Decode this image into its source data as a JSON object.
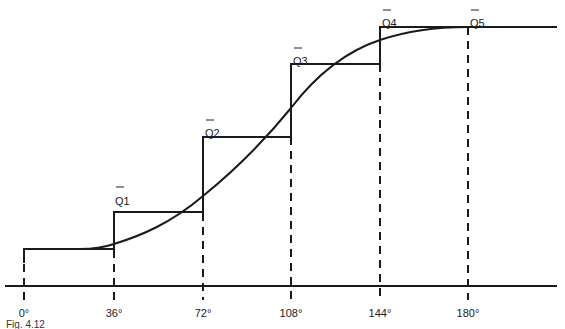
{
  "diagram": {
    "type": "staircase-approximation-of-sinusoid",
    "x_axis": {
      "ticks": [
        "0°",
        "36°",
        "72°",
        "108°",
        "144°",
        "180°"
      ],
      "tick_values": [
        0,
        36,
        72,
        108,
        144,
        180
      ]
    },
    "step_labels": [
      {
        "name": "Q1",
        "overbar": true,
        "x_range": [
          "36°",
          "72°"
        ]
      },
      {
        "name": "Q2",
        "overbar": true,
        "x_range": [
          "72°",
          "108°"
        ]
      },
      {
        "name": "Q3",
        "overbar": true,
        "x_range": [
          "108°",
          "144°"
        ]
      },
      {
        "name": "Q4",
        "overbar": true,
        "x_range": [
          "144°",
          "180°"
        ]
      },
      {
        "name": "Q5",
        "overbar": true,
        "x_range": [
          "180°",
          "end"
        ]
      }
    ],
    "curve": "smooth S-shaped curve rising from the 0° level to the Q5 level at 180°",
    "caption": "Fig. 4.12"
  },
  "colors": {
    "line": "#1a1a1a",
    "background": "#ffffff"
  }
}
